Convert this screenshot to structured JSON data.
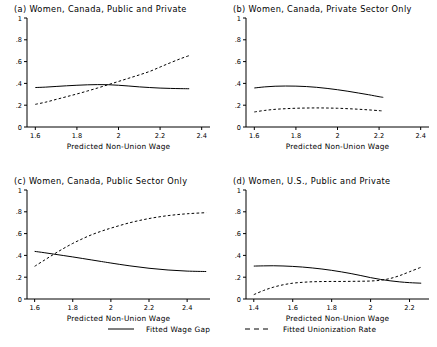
{
  "figure": {
    "width": 437,
    "height": 347,
    "background": "#ffffff",
    "line_color": "#000000"
  },
  "legend": {
    "entries": [
      {
        "label": "Fitted Wage Gap",
        "style": "solid",
        "icon": "solid-line-icon"
      },
      {
        "label": "Fitted Unionization Rate",
        "style": "dashed",
        "icon": "dashed-line-icon"
      }
    ]
  },
  "chart_data": [
    {
      "type": "line",
      "panel": "a",
      "title": "(a) Women, Canada, Public and Private",
      "xlabel": "Predicted Non-Union Wage",
      "ylabel": "",
      "xlim": [
        1.56,
        2.44
      ],
      "ylim": [
        0,
        1
      ],
      "xticks": [
        1.6,
        1.8,
        2,
        2.2,
        2.4
      ],
      "xticklabels": [
        "1.6",
        "1.8",
        "2",
        "2.2",
        "2.4"
      ],
      "yticks": [
        0,
        0.2,
        0.4,
        0.6,
        0.8,
        1
      ],
      "yticklabels": [
        "0",
        ".2",
        ".4",
        ".6",
        ".8",
        "1"
      ],
      "grid": false,
      "legend_position": "figure-bottom",
      "series": [
        {
          "name": "Fitted Wage Gap",
          "style": "solid",
          "x": [
            1.6,
            1.65,
            1.7,
            1.75,
            1.8,
            1.85,
            1.9,
            1.95,
            2.0,
            2.05,
            2.1,
            2.15,
            2.2,
            2.25,
            2.3,
            2.34
          ],
          "values": [
            0.362,
            0.366,
            0.372,
            0.378,
            0.383,
            0.387,
            0.389,
            0.388,
            0.383,
            0.376,
            0.368,
            0.362,
            0.357,
            0.354,
            0.352,
            0.351
          ]
        },
        {
          "name": "Fitted Unionization Rate",
          "style": "dashed",
          "x": [
            1.6,
            1.65,
            1.7,
            1.75,
            1.8,
            1.85,
            1.9,
            1.95,
            2.0,
            2.05,
            2.1,
            2.15,
            2.2,
            2.25,
            2.3,
            2.34
          ],
          "values": [
            0.208,
            0.228,
            0.253,
            0.278,
            0.303,
            0.33,
            0.358,
            0.388,
            0.418,
            0.448,
            0.478,
            0.51,
            0.55,
            0.59,
            0.628,
            0.655
          ]
        }
      ]
    },
    {
      "type": "line",
      "panel": "b",
      "title": "(b) Women, Canada, Private Sector Only",
      "xlabel": "Predicted Non-Union Wage",
      "ylabel": "",
      "xlim": [
        1.56,
        2.44
      ],
      "ylim": [
        0,
        1
      ],
      "xticks": [
        1.6,
        1.8,
        2,
        2.2,
        2.4
      ],
      "xticklabels": [
        "1.6",
        "1.8",
        "2",
        "2.2",
        "2.4"
      ],
      "yticks": [
        0,
        0.2,
        0.4,
        0.6,
        0.8,
        1
      ],
      "yticklabels": [
        "0",
        ".2",
        ".4",
        ".6",
        ".8",
        "1"
      ],
      "grid": false,
      "legend_position": "figure-bottom",
      "series": [
        {
          "name": "Fitted Wage Gap",
          "style": "solid",
          "x": [
            1.6,
            1.65,
            1.7,
            1.75,
            1.8,
            1.85,
            1.9,
            1.95,
            2.0,
            2.05,
            2.1,
            2.15,
            2.2,
            2.22
          ],
          "values": [
            0.358,
            0.368,
            0.374,
            0.376,
            0.375,
            0.371,
            0.364,
            0.354,
            0.342,
            0.328,
            0.312,
            0.296,
            0.278,
            0.272
          ]
        },
        {
          "name": "Fitted Unionization Rate",
          "style": "dashed",
          "x": [
            1.6,
            1.65,
            1.7,
            1.75,
            1.8,
            1.85,
            1.9,
            1.95,
            2.0,
            2.05,
            2.1,
            2.15,
            2.2,
            2.22
          ],
          "values": [
            0.138,
            0.152,
            0.162,
            0.168,
            0.172,
            0.174,
            0.175,
            0.174,
            0.172,
            0.168,
            0.163,
            0.157,
            0.15,
            0.147
          ]
        }
      ]
    },
    {
      "type": "line",
      "panel": "c",
      "title": "(c) Women, Canada, Public Sector Only",
      "xlabel": "Predicted Non-Union Wage",
      "ylabel": "",
      "xlim": [
        1.56,
        2.52
      ],
      "ylim": [
        0,
        1
      ],
      "xticks": [
        1.6,
        1.8,
        2,
        2.2,
        2.4
      ],
      "xticklabels": [
        "1.6",
        "1.8",
        "2",
        "2.2",
        "2.4"
      ],
      "yticks": [
        0,
        0.2,
        0.4,
        0.6,
        0.8,
        1
      ],
      "yticklabels": [
        "0",
        ".2",
        ".4",
        ".6",
        ".8",
        "1"
      ],
      "grid": false,
      "legend_position": "figure-bottom",
      "series": [
        {
          "name": "Fitted Wage Gap",
          "style": "solid",
          "x": [
            1.6,
            1.65,
            1.7,
            1.75,
            1.8,
            1.85,
            1.9,
            1.95,
            2.0,
            2.1,
            2.2,
            2.3,
            2.4,
            2.5
          ],
          "values": [
            0.437,
            0.425,
            0.412,
            0.399,
            0.386,
            0.372,
            0.358,
            0.344,
            0.33,
            0.304,
            0.282,
            0.266,
            0.256,
            0.252
          ]
        },
        {
          "name": "Fitted Unionization Rate",
          "style": "dashed",
          "x": [
            1.6,
            1.65,
            1.7,
            1.75,
            1.8,
            1.85,
            1.9,
            1.95,
            2.0,
            2.1,
            2.2,
            2.3,
            2.4,
            2.5
          ],
          "values": [
            0.3,
            0.355,
            0.41,
            0.462,
            0.51,
            0.552,
            0.59,
            0.622,
            0.65,
            0.7,
            0.738,
            0.765,
            0.782,
            0.792
          ]
        }
      ]
    },
    {
      "type": "line",
      "panel": "d",
      "title": "(d) Women, U.S., Public and Private",
      "xlabel": "Predicted Non-Union Wage",
      "ylabel": "",
      "xlim": [
        1.36,
        2.3
      ],
      "ylim": [
        0,
        1
      ],
      "xticks": [
        1.4,
        1.6,
        1.8,
        2,
        2.2
      ],
      "xticklabels": [
        "1.4",
        "1.6",
        "1.8",
        "2",
        "2.2"
      ],
      "yticks": [
        0,
        0.2,
        0.4,
        0.6,
        0.8,
        1
      ],
      "yticklabels": [
        "0",
        ".2",
        ".4",
        ".6",
        ".8",
        "1"
      ],
      "grid": false,
      "legend_position": "figure-bottom",
      "series": [
        {
          "name": "Fitted Wage Gap",
          "style": "solid",
          "x": [
            1.4,
            1.45,
            1.5,
            1.55,
            1.6,
            1.65,
            1.7,
            1.75,
            1.8,
            1.85,
            1.9,
            1.95,
            2.0,
            2.05,
            2.1,
            2.15,
            2.2,
            2.26
          ],
          "values": [
            0.302,
            0.304,
            0.305,
            0.303,
            0.299,
            0.293,
            0.285,
            0.275,
            0.263,
            0.249,
            0.233,
            0.215,
            0.196,
            0.18,
            0.167,
            0.157,
            0.15,
            0.145
          ]
        },
        {
          "name": "Fitted Unionization Rate",
          "style": "dashed",
          "x": [
            1.4,
            1.45,
            1.5,
            1.55,
            1.6,
            1.65,
            1.7,
            1.75,
            1.8,
            1.85,
            1.9,
            1.95,
            2.0,
            2.05,
            2.1,
            2.15,
            2.2,
            2.26
          ],
          "values": [
            0.04,
            0.078,
            0.108,
            0.13,
            0.145,
            0.153,
            0.158,
            0.16,
            0.161,
            0.161,
            0.162,
            0.163,
            0.165,
            0.172,
            0.188,
            0.215,
            0.25,
            0.292
          ]
        }
      ]
    }
  ]
}
